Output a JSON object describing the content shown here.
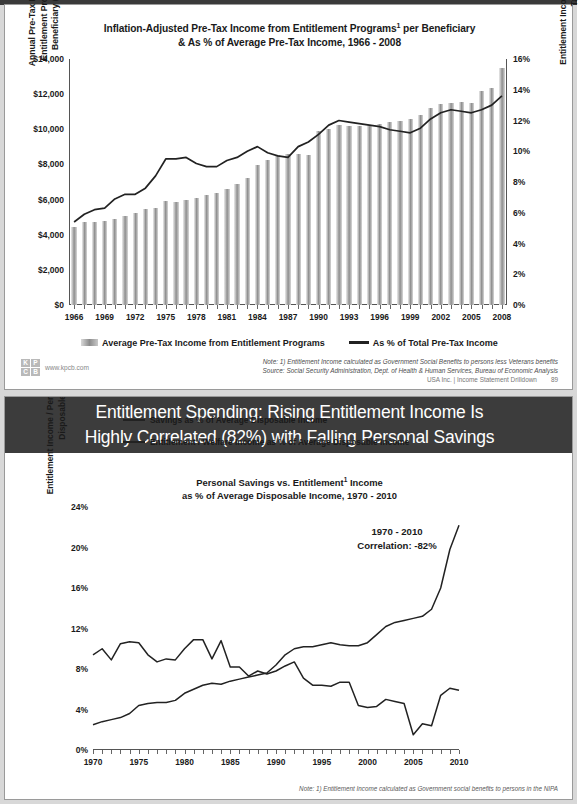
{
  "slide1": {
    "title_line1": "Inflation-Adjusted Pre-Tax Income from Entitlement Programs",
    "title_sup": "1",
    "title_line1_tail": " per Beneficiary",
    "title_line2": "& As % of Average Pre-Tax Income, 1966 - 2008",
    "ylabel_left": "Annual Pre-Tax Income from Entitlement Programs per Beneficiary ($ / year)",
    "ylabel_right": "Entitlement Income as % of Average Pre-Tax Income",
    "legend_bar": "Average Pre-Tax Income from Entitlement Programs",
    "legend_line": "As % of Total Pre-Tax Income",
    "note": "Note: 1) Entitlement Income calculated as Government Social Benefits to persons less Veterans benefits",
    "source": "Source: Social Security Administration, Dept. of Health & Human Services, Bureau of Economic Analysis",
    "footer_text": "USA Inc. | Income Statement Drilldown",
    "page_number": "89",
    "kpcb_letters": [
      "K",
      "P",
      "C",
      "B"
    ],
    "kpcb_url": "www.kpcb.com"
  },
  "slide2": {
    "header_line1": "Entitlement Spending: Rising Entitlement Income Is",
    "header_line2": "Highly Correlated (82%) with Falling Personal Savings",
    "title_line1": "Personal Savings vs. Entitlement",
    "title_sup": "1",
    "title_line1_tail": " Income",
    "title_line2": "as % of Average Disposable Income, 1970 - 2010",
    "ylabel": "Entitlement Income / Personal Savings as % of Disposable Income",
    "legend_savings": "Savings as % of Average Disposable Income",
    "legend_entitlement": "Entitlement / Welfare Income as % of Average Disposable Income",
    "annotation_line1": "1970 - 2010",
    "annotation_line2": "Correlation: -82%",
    "note": "Note: 1) Entitlement Income calculated as Government social benefits to persons in the NIPA"
  },
  "colors": {
    "header_dark": "#3c3c3c",
    "line": "#222222",
    "bar_mid": "#8e8e8e",
    "axis": "#555555"
  },
  "chart_data": [
    {
      "type": "bar",
      "title": "Inflation-Adjusted Pre-Tax Income from Entitlement Programs per Beneficiary & As % of Average Pre-Tax Income, 1966 - 2008",
      "xlabel": "",
      "ylabel": "Annual Pre-Tax Income from Entitlement Programs per Beneficiary ($ / year)",
      "ylabel_secondary": "Entitlement Income as % of Average Pre-Tax Income",
      "ylim": [
        0,
        14000
      ],
      "ylim_secondary": [
        0,
        16
      ],
      "yticks": [
        "$0",
        "$2,000",
        "$4,000",
        "$6,000",
        "$8,000",
        "$10,000",
        "$12,000",
        "$14,000"
      ],
      "yticks_secondary": [
        "0%",
        "2%",
        "4%",
        "6%",
        "8%",
        "10%",
        "12%",
        "14%",
        "16%"
      ],
      "grid": false,
      "legend_position": "bottom",
      "x": [
        1966,
        1967,
        1968,
        1969,
        1970,
        1971,
        1972,
        1973,
        1974,
        1975,
        1976,
        1977,
        1978,
        1979,
        1980,
        1981,
        1982,
        1983,
        1984,
        1985,
        1986,
        1987,
        1988,
        1989,
        1990,
        1991,
        1992,
        1993,
        1994,
        1995,
        1996,
        1997,
        1998,
        1999,
        2000,
        2001,
        2002,
        2003,
        2004,
        2005,
        2006,
        2007,
        2008
      ],
      "xtick_labels": [
        "1966",
        "1969",
        "1972",
        "1975",
        "1978",
        "1981",
        "1984",
        "1987",
        "1990",
        "1993",
        "1996",
        "1999",
        "2002",
        "2005",
        "2008"
      ],
      "series": [
        {
          "name": "Average Pre-Tax Income from Entitlement Programs",
          "axis": "left",
          "type": "bar",
          "values": [
            4450,
            4700,
            4720,
            4780,
            4900,
            5050,
            5250,
            5450,
            5520,
            5900,
            5850,
            6000,
            6100,
            6250,
            6400,
            6600,
            6900,
            7250,
            7950,
            8250,
            8550,
            8600,
            8600,
            8550,
            9900,
            10000,
            10250,
            10200,
            10200,
            10250,
            10300,
            10400,
            10500,
            10600,
            10800,
            11200,
            11450,
            11500,
            11550,
            11500,
            12200,
            12350,
            13500
          ]
        },
        {
          "name": "As % of Total Pre-Tax Income",
          "axis": "right",
          "type": "line",
          "values": [
            5.4,
            5.9,
            6.2,
            6.3,
            6.9,
            7.2,
            7.2,
            7.6,
            8.4,
            9.5,
            9.5,
            9.6,
            9.2,
            9.0,
            9.0,
            9.4,
            9.6,
            10.0,
            10.3,
            9.9,
            9.7,
            9.6,
            10.3,
            10.6,
            11.1,
            11.7,
            12.0,
            11.9,
            11.8,
            11.7,
            11.6,
            11.4,
            11.3,
            11.2,
            11.5,
            12.1,
            12.5,
            12.7,
            12.6,
            12.5,
            12.7,
            13.0,
            13.6
          ]
        }
      ]
    },
    {
      "type": "line",
      "title": "Personal Savings vs. Entitlement Income as % of Average Disposable Income, 1970 - 2010",
      "xlabel": "",
      "ylabel": "Entitlement Income / Personal Savings as % of Disposable Income",
      "ylim": [
        0,
        24
      ],
      "yticks": [
        "0%",
        "4%",
        "8%",
        "12%",
        "16%",
        "20%",
        "24%"
      ],
      "grid": false,
      "legend_position": "top",
      "annotation": "1970 - 2010 Correlation: -82%",
      "x": [
        1970,
        1971,
        1972,
        1973,
        1974,
        1975,
        1976,
        1977,
        1978,
        1979,
        1980,
        1981,
        1982,
        1983,
        1984,
        1985,
        1986,
        1987,
        1988,
        1989,
        1990,
        1991,
        1992,
        1993,
        1994,
        1995,
        1996,
        1997,
        1998,
        1999,
        2000,
        2001,
        2002,
        2003,
        2004,
        2005,
        2006,
        2007,
        2008,
        2009,
        2010
      ],
      "xtick_labels": [
        "1970",
        "1975",
        "1980",
        "1985",
        "1990",
        "1995",
        "2000",
        "2005",
        "2010"
      ],
      "series": [
        {
          "name": "Savings as % of Average Disposable Income",
          "values": [
            9.4,
            10.0,
            8.9,
            10.5,
            10.7,
            10.6,
            9.4,
            8.7,
            9.0,
            8.9,
            10.0,
            10.9,
            10.9,
            9.0,
            10.8,
            8.2,
            8.2,
            7.3,
            7.8,
            7.5,
            7.8,
            8.3,
            8.7,
            7.1,
            6.4,
            6.4,
            6.3,
            6.7,
            6.7,
            4.4,
            4.2,
            4.3,
            5.0,
            4.8,
            4.6,
            1.5,
            2.6,
            2.4,
            5.4,
            6.1,
            5.9
          ]
        },
        {
          "name": "Entitlement / Welfare Income as % of Average Disposable Income",
          "values": [
            2.5,
            2.8,
            3.0,
            3.2,
            3.6,
            4.4,
            4.6,
            4.7,
            4.7,
            4.9,
            5.6,
            6.0,
            6.4,
            6.6,
            6.5,
            6.8,
            7.0,
            7.2,
            7.4,
            7.6,
            8.4,
            9.4,
            10.0,
            10.2,
            10.2,
            10.4,
            10.6,
            10.4,
            10.3,
            10.3,
            10.6,
            11.4,
            12.2,
            12.6,
            12.8,
            13.0,
            13.2,
            13.9,
            16.0,
            19.8,
            22.2
          ]
        }
      ]
    }
  ]
}
